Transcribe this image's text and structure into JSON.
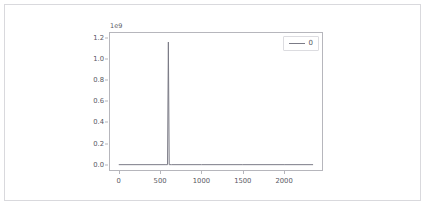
{
  "figure": {
    "background": "#ffffff",
    "border_color": "#d9d9dd",
    "axes_spine_color": "#b6b6bc",
    "line_color": "#7b7b86",
    "tick_label_color": "#58585f"
  },
  "axes": {
    "offset_text": "1e9",
    "ytick_labels": [
      "0.0",
      "0.2",
      "0.4",
      "0.6",
      "0.8",
      "1.0",
      "1.2"
    ],
    "ytick_values": [
      0.0,
      0.2,
      0.4,
      0.6,
      0.8,
      1.0,
      1.2
    ],
    "xtick_labels": [
      "0",
      "500",
      "1000",
      "1500",
      "2000"
    ],
    "xtick_values": [
      0,
      500,
      1000,
      1500,
      2000
    ]
  },
  "legend": {
    "entries": [
      {
        "label": "0",
        "color": "#7b7b86"
      }
    ]
  },
  "chart_data": {
    "type": "line",
    "title": "",
    "xlabel": "",
    "ylabel": "",
    "y_offset_exponent": "1e9",
    "xlim": [
      -118,
      2470
    ],
    "ylim": [
      -60000000.0,
      1255000000.0
    ],
    "grid": false,
    "legend_position": "upper right",
    "series": [
      {
        "name": "0",
        "color": "#7b7b86",
        "comment": "Flat near-zero baseline across the full x range with one tall narrow spike",
        "x": [
          0,
          560,
          590,
          600,
          610,
          640,
          1000,
          1500,
          2000,
          2350
        ],
        "values": [
          0,
          0,
          0,
          1160000000,
          0,
          0,
          0,
          0,
          0,
          0
        ]
      }
    ],
    "annotations": [
      {
        "type": "spike",
        "x": 600,
        "y": 1160000000,
        "label": "single dominant peak near x=600 reaching ~1.16e9"
      }
    ]
  }
}
